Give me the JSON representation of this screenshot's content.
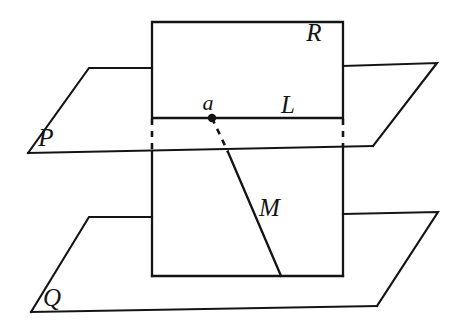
{
  "figure": {
    "background_color": "#ffffff",
    "stroke_color": "#141414",
    "width": 464,
    "height": 334
  },
  "labels": {
    "plane_upper": "P",
    "plane_lower": "Q",
    "region_rect": "R",
    "line_upper": "L",
    "line_lower": "M",
    "point": "a"
  },
  "label_positions": {
    "plane_upper": {
      "x": 46,
      "y": 146
    },
    "plane_lower": {
      "x": 52,
      "y": 306
    },
    "region_rect": {
      "x": 314,
      "y": 41
    },
    "line_upper": {
      "x": 288,
      "y": 113
    },
    "line_lower": {
      "x": 259,
      "y": 216
    },
    "point": {
      "x": 201,
      "y": 110
    }
  },
  "geometry": {
    "rect_upper": {
      "left": 152,
      "top": 22,
      "right": 343,
      "bottom": 118
    },
    "rect_lower": {
      "left": 152,
      "top": 152,
      "right": 343,
      "bottom": 276
    },
    "plane_p": {
      "top_left": {
        "x": 89,
        "y": 68
      },
      "top_right": {
        "x": 437,
        "y": 63
      },
      "bottom_right": {
        "x": 373,
        "y": 146
      },
      "bottom_left": {
        "x": 28,
        "y": 153
      }
    },
    "plane_q": {
      "top_left": {
        "x": 89,
        "y": 217
      },
      "top_right": {
        "x": 438,
        "y": 212
      },
      "bottom_right": {
        "x": 377,
        "y": 306
      },
      "bottom_left": {
        "x": 31,
        "y": 312
      }
    },
    "point_a": {
      "x": 212,
      "y": 118
    },
    "line_m_end": {
      "x": 281,
      "y": 276
    },
    "dashed_left": {
      "x": 152,
      "y_top": 119,
      "y_bottom": 151
    },
    "dashed_right": {
      "x": 343,
      "y_top": 119,
      "y_bottom": 147
    }
  }
}
